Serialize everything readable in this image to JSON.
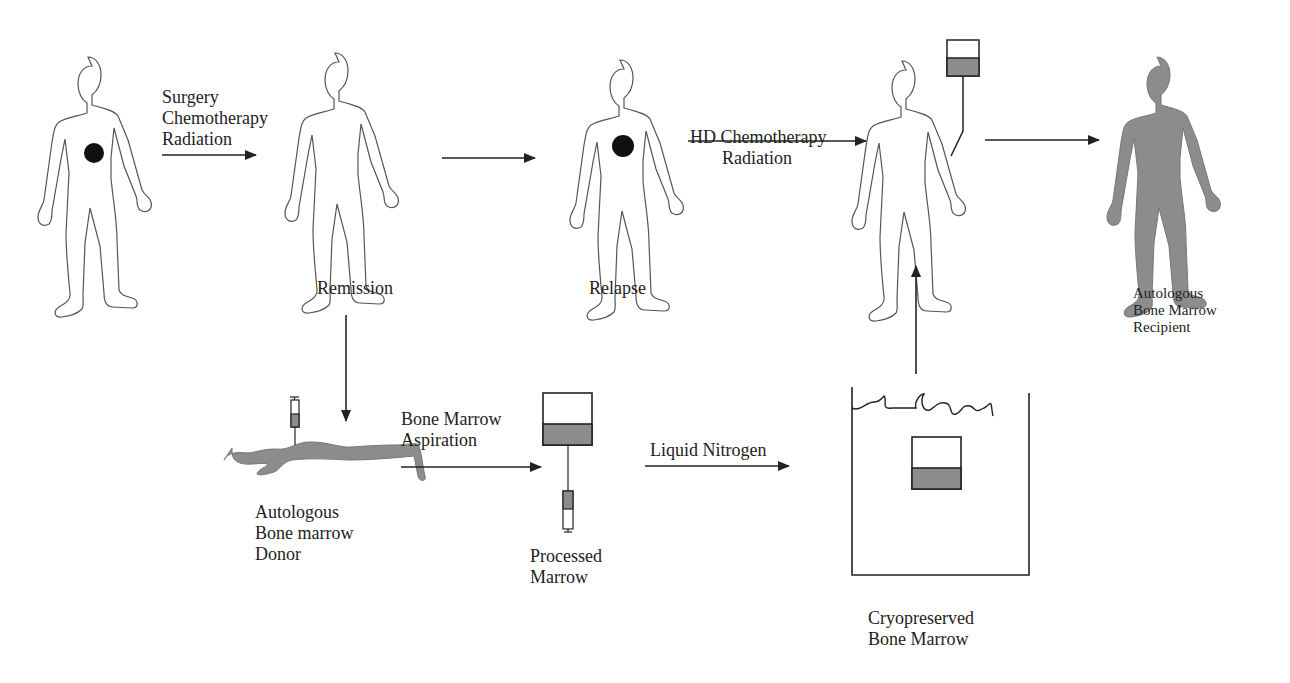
{
  "diagram": {
    "type": "flow",
    "colors": {
      "ink": "#222222",
      "fill_gray": "#8c8c8c",
      "background": "#ffffff"
    },
    "stages": {
      "patient_tumor": {
        "label": ""
      },
      "remission": {
        "label": "Remission"
      },
      "relapse": {
        "label": "Relapse"
      },
      "treated_patient": {
        "label": ""
      },
      "recipient": {
        "lines": [
          "Autologous",
          "Bone Marrow",
          "Recipient"
        ]
      },
      "donor": {
        "lines": [
          "Autologous",
          "Bone marrow",
          "Donor"
        ]
      },
      "processed": {
        "lines": [
          "Processed",
          "Marrow"
        ]
      },
      "cryo": {
        "lines": [
          "Cryopreserved",
          "Bone Marrow"
        ]
      }
    },
    "arrows": {
      "initial_treatment": {
        "lines": [
          "Surgery",
          "Chemotherapy",
          "Radiation"
        ]
      },
      "hd_treatment": {
        "lines": [
          "HD Chemotherapy",
          "Radiation"
        ]
      },
      "aspiration": {
        "lines": [
          "Bone Marrow",
          "Aspiration"
        ]
      },
      "freezing": {
        "lines": [
          "Liquid Nitrogen"
        ]
      }
    }
  }
}
